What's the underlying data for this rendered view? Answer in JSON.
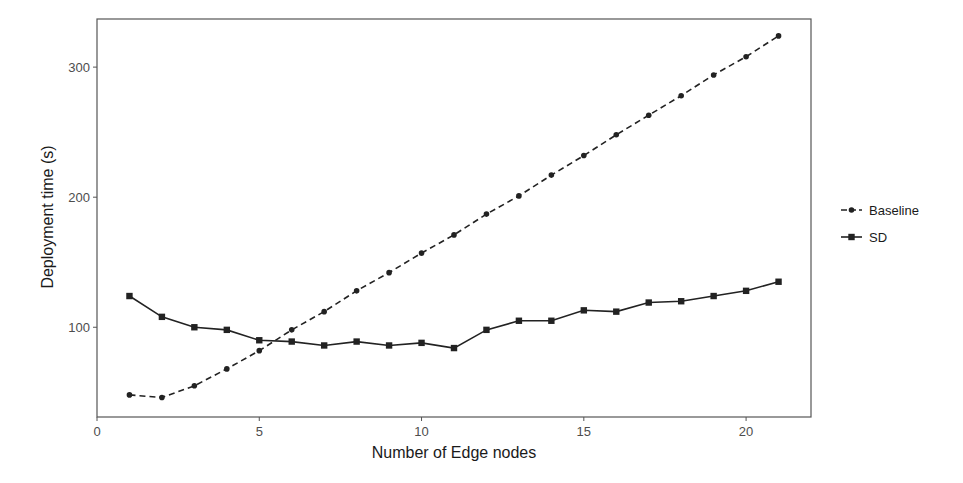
{
  "chart_data": {
    "type": "line",
    "title": "",
    "xlabel": "Number of Edge nodes",
    "ylabel": "Deployment time (s)",
    "x": [
      1,
      2,
      3,
      4,
      5,
      6,
      7,
      8,
      9,
      10,
      11,
      12,
      13,
      14,
      15,
      16,
      17,
      18,
      19,
      20,
      21
    ],
    "xlim": [
      0,
      22
    ],
    "ylim": [
      31,
      337
    ],
    "xticks": [
      0,
      5,
      10,
      15,
      20
    ],
    "yticks": [
      100,
      200,
      300
    ],
    "grid": false,
    "legend_position": "right",
    "series": [
      {
        "name": "Baseline",
        "linestyle": "dashed",
        "marker": "circle",
        "color": "#222222",
        "values": [
          48,
          46,
          55,
          68,
          82,
          98,
          112,
          128,
          142,
          157,
          171,
          187,
          201,
          217,
          232,
          248,
          263,
          278,
          294,
          308,
          324
        ]
      },
      {
        "name": "SD",
        "linestyle": "solid",
        "marker": "square",
        "color": "#222222",
        "values": [
          124,
          108,
          100,
          98,
          90,
          89,
          86,
          89,
          86,
          88,
          84,
          98,
          105,
          105,
          113,
          112,
          119,
          120,
          124,
          128,
          135
        ]
      }
    ]
  }
}
